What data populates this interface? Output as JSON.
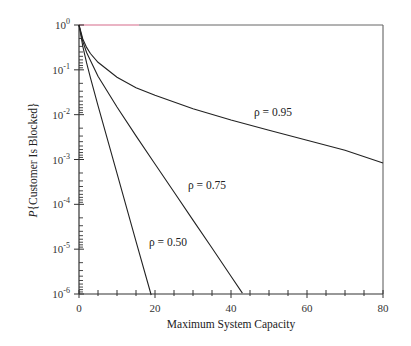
{
  "chart_data": {
    "type": "line",
    "title": "",
    "xlabel": "Maximum System Capacity",
    "ylabel": "P{Customer Is Blocked}",
    "xlim": [
      0,
      80
    ],
    "ylim": [
      1e-06,
      1
    ],
    "yscale": "log",
    "grid": false,
    "legend": "inline labels",
    "x_ticks": [
      0,
      20,
      40,
      60,
      80
    ],
    "x_tick_labels": [
      "0",
      "20",
      "40",
      "60",
      "80"
    ],
    "y_tick_labels": [
      {
        "base": "10",
        "exp": "0"
      },
      {
        "base": "10",
        "exp": "-1"
      },
      {
        "base": "10",
        "exp": "-2"
      },
      {
        "base": "10",
        "exp": "-3"
      },
      {
        "base": "10",
        "exp": "-4"
      },
      {
        "base": "10",
        "exp": "-5"
      },
      {
        "base": "10",
        "exp": "-6"
      }
    ],
    "series": [
      {
        "name": "ρ = 0.95",
        "label": "ρ = 0.95",
        "x": [
          0,
          1,
          2,
          3,
          5,
          10,
          15,
          20,
          30,
          40,
          50,
          60,
          70,
          80
        ],
        "values": [
          1,
          0.487,
          0.316,
          0.231,
          0.147,
          0.068,
          0.04,
          0.027,
          0.0136,
          0.0076,
          0.0045,
          0.0027,
          0.0016,
          0.00084
        ]
      },
      {
        "name": "ρ = 0.75",
        "label": "ρ = 0.75",
        "x": [
          0,
          1,
          2,
          5,
          10,
          15,
          20,
          25,
          30,
          35,
          40,
          43
        ],
        "values": [
          1,
          0.429,
          0.243,
          0.0722,
          0.0148,
          0.00336,
          0.000792,
          0.000188,
          4.45e-05,
          1.06e-05,
          2.5e-06,
          1.05e-06
        ]
      },
      {
        "name": "ρ = 0.50",
        "label": "ρ = 0.50",
        "x": [
          0,
          1,
          2,
          3,
          5,
          10,
          15,
          19
        ],
        "values": [
          1,
          0.333,
          0.143,
          0.0667,
          0.0159,
          0.00049,
          1.5e-05,
          9.5e-07
        ]
      }
    ],
    "annotations": [
      {
        "text": "ρ = 0.95",
        "x": 46,
        "y": 0.012
      },
      {
        "text": "ρ = 0.75",
        "x": 28,
        "y": 0.00028
      },
      {
        "text": "ρ = 0.50",
        "x": 18,
        "y": 1.5e-05
      }
    ]
  },
  "colors": {
    "axis": "#333333",
    "curve": "#222222",
    "top_edge": "#d66a8a"
  }
}
